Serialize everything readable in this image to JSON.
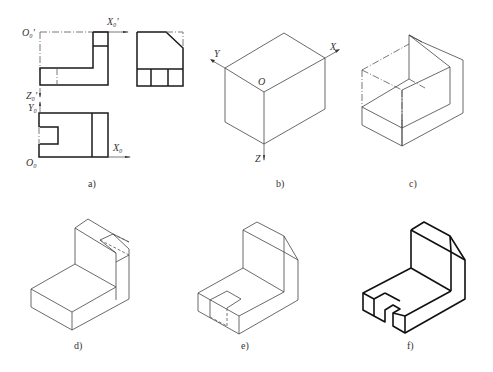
{
  "figure": {
    "panels": [
      {
        "id": "a",
        "caption": "a)",
        "description": "Three orthographic views with axes",
        "axis_labels": {
          "o_prime": "O₀′",
          "x_prime": "X₀′",
          "z_prime": "Z₀′",
          "y": "Y₀",
          "o": "O₀",
          "x": "X₀"
        }
      },
      {
        "id": "b",
        "caption": "b)",
        "description": "Isometric bounding box with axes",
        "axis_labels": {
          "x": "X",
          "y": "Y",
          "z": "Z",
          "o": "O"
        }
      },
      {
        "id": "c",
        "caption": "c)",
        "description": "Bounding box with L-shaped cut"
      },
      {
        "id": "d",
        "caption": "d)",
        "description": "L-shape with chamfer construction"
      },
      {
        "id": "e",
        "caption": "e)",
        "description": "Chamfered L-shape with slot construction"
      },
      {
        "id": "f",
        "caption": "f)",
        "description": "Finished isometric drawing"
      }
    ]
  }
}
